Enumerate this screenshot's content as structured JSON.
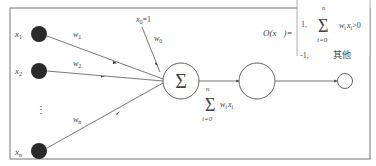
{
  "diagram": {
    "inputs": [
      {
        "label": "x",
        "sub": "1",
        "weight": "w",
        "weight_sub": "1"
      },
      {
        "label": "x",
        "sub": "2",
        "weight": "w",
        "weight_sub": "2"
      },
      {
        "label": "x",
        "sub": "n",
        "weight": "w",
        "weight_sub": "n"
      }
    ],
    "ellipsis": "⋮",
    "bias": {
      "label": "x",
      "sub": "0",
      "eq": "=1",
      "weight": "w",
      "weight_sub": "0"
    },
    "sum_node": {
      "symbol": "Σ"
    },
    "sum_expr": {
      "top": "n",
      "symbol": "Σ",
      "bottom": "i=0",
      "term": "w",
      "term_sub": "i",
      "term2": "x",
      "term2_sub": "i"
    },
    "activation_node": {
      "label": ""
    },
    "output_node": {
      "label": ""
    },
    "formula": {
      "lhs": "O(x⃗)=",
      "case1_value": "1,",
      "case1_top": "n",
      "case1_sum": "Σ",
      "case1_bottom": "i=0",
      "case1_cond": "w",
      "case1_cond_sub": "i",
      "case1_cond2": "x",
      "case1_cond2_sub": "i",
      "case1_cond3": ">0",
      "case2_value": "-1,",
      "case2_cond": "其他"
    }
  },
  "colors": {
    "node_fill": "#2a2a2a",
    "line": "#555555",
    "frame": "#777777"
  }
}
